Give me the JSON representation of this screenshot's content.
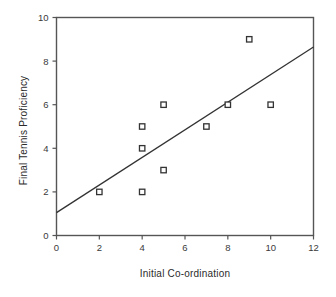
{
  "chart_data": {
    "type": "scatter",
    "title": "",
    "xlabel": "Initial Co-ordination",
    "ylabel": "Final Tennis Proficiency",
    "xlim": [
      0,
      12
    ],
    "ylim": [
      0,
      10
    ],
    "xticks": [
      0,
      2,
      4,
      6,
      8,
      10,
      12
    ],
    "yticks": [
      0,
      2,
      4,
      6,
      8,
      10
    ],
    "xtick_labels": [
      "0",
      "2",
      "4",
      "6",
      "8",
      "10",
      "12"
    ],
    "ytick_labels": [
      "0",
      "2",
      "4",
      "6",
      "8",
      "10"
    ],
    "grid": false,
    "legend": null,
    "marker": "open-square",
    "marker_color": "#333333",
    "line_color": "#333333",
    "axis_color": "#555555",
    "points": [
      {
        "x": 2,
        "y": 2
      },
      {
        "x": 4,
        "y": 2
      },
      {
        "x": 4,
        "y": 4
      },
      {
        "x": 4,
        "y": 5
      },
      {
        "x": 5,
        "y": 3
      },
      {
        "x": 5,
        "y": 6
      },
      {
        "x": 7,
        "y": 5
      },
      {
        "x": 8,
        "y": 6
      },
      {
        "x": 9,
        "y": 9
      },
      {
        "x": 10,
        "y": 6
      }
    ],
    "trendline": {
      "name": "regression line",
      "x0": 0,
      "y0": 1.05,
      "x1": 12,
      "y1": 8.65
    }
  }
}
